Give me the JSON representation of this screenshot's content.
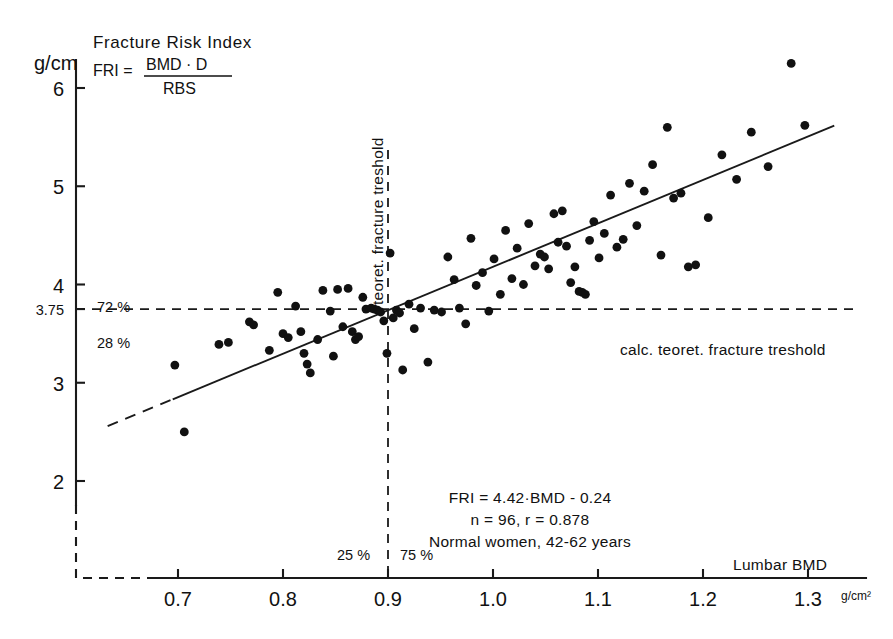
{
  "figure": {
    "title": "Fracture Risk Index",
    "formula": {
      "lhs": "FRI =",
      "numerator": "BMD · D",
      "denominator": "RBS"
    },
    "y_unit": "g/cm",
    "x_axis_title": "Lumbar BMD",
    "x_unit": "g/cm²"
  },
  "annotations": {
    "regression_text": "FRI = 4.42·BMD - 0.24",
    "stats_text": "n = 96,  r = 0.878",
    "sample_text": "Normal women, 42-62 years",
    "vertical_threshold_label": "teoret. fracture treshold",
    "horizontal_threshold_label": "calc. teoret. fracture treshold",
    "pct_above": "72 %",
    "pct_below": "28 %",
    "pct_left": "25 %",
    "pct_right": "75 %",
    "threshold_y_label": "3.75"
  },
  "chart_data": {
    "type": "scatter",
    "title": "Fracture Risk Index",
    "xlabel": "Lumbar BMD",
    "ylabel": "g/cm",
    "xunit": "g/cm²",
    "yunit": "g/cm",
    "xlim": [
      0.63,
      1.33
    ],
    "ylim": [
      1.6,
      6.45
    ],
    "xticks": [
      0.7,
      0.8,
      0.9,
      1.0,
      1.1,
      1.2,
      1.3
    ],
    "xtick_labels": [
      "0.7",
      "0.8",
      "0.9",
      "1.0",
      "1.1",
      "1.2",
      "1.3"
    ],
    "yticks": [
      2,
      3,
      3.75,
      4,
      5,
      6
    ],
    "ytick_labels": [
      "2",
      "3",
      "3.75",
      "4",
      "5",
      "6"
    ],
    "grid": false,
    "legend": "none",
    "n": 96,
    "r": 0.878,
    "regression": {
      "slope": 4.42,
      "intercept": -0.24,
      "label": "FRI = 4.42·BMD - 0.24",
      "solid_x_range": [
        0.695,
        1.325
      ],
      "dashed_x_range": [
        0.633,
        0.695
      ]
    },
    "thresholds": {
      "horizontal_y": 3.75,
      "horizontal_label": "calc. teoret. fracture treshold",
      "vertical_x": 0.9,
      "vertical_label": "teoret. fracture treshold",
      "pct_above_horizontal": 72,
      "pct_below_horizontal": 28,
      "pct_left_vertical": 25,
      "pct_right_vertical": 75
    },
    "points": [
      [
        0.697,
        3.18
      ],
      [
        0.706,
        2.5
      ],
      [
        0.739,
        3.39
      ],
      [
        0.748,
        3.41
      ],
      [
        0.768,
        3.62
      ],
      [
        0.772,
        3.59
      ],
      [
        0.787,
        3.33
      ],
      [
        0.795,
        3.92
      ],
      [
        0.8,
        3.5
      ],
      [
        0.805,
        3.46
      ],
      [
        0.812,
        3.78
      ],
      [
        0.817,
        3.52
      ],
      [
        0.82,
        3.3
      ],
      [
        0.823,
        3.19
      ],
      [
        0.826,
        3.1
      ],
      [
        0.833,
        3.44
      ],
      [
        0.838,
        3.94
      ],
      [
        0.845,
        3.73
      ],
      [
        0.848,
        3.27
      ],
      [
        0.852,
        3.95
      ],
      [
        0.857,
        3.57
      ],
      [
        0.862,
        3.96
      ],
      [
        0.866,
        3.52
      ],
      [
        0.869,
        3.44
      ],
      [
        0.872,
        3.47
      ],
      [
        0.876,
        3.87
      ],
      [
        0.879,
        3.75
      ],
      [
        0.884,
        3.76
      ],
      [
        0.887,
        3.75
      ],
      [
        0.89,
        3.74
      ],
      [
        0.893,
        3.72
      ],
      [
        0.896,
        3.63
      ],
      [
        0.899,
        3.3
      ],
      [
        0.902,
        4.32
      ],
      [
        0.905,
        3.66
      ],
      [
        0.908,
        3.74
      ],
      [
        0.911,
        3.71
      ],
      [
        0.914,
        3.13
      ],
      [
        0.92,
        3.8
      ],
      [
        0.925,
        3.55
      ],
      [
        0.931,
        3.76
      ],
      [
        0.938,
        3.21
      ],
      [
        0.944,
        3.74
      ],
      [
        0.951,
        3.72
      ],
      [
        0.957,
        4.28
      ],
      [
        0.963,
        4.05
      ],
      [
        0.968,
        3.76
      ],
      [
        0.974,
        3.6
      ],
      [
        0.979,
        4.47
      ],
      [
        0.984,
        3.99
      ],
      [
        0.99,
        4.12
      ],
      [
        0.996,
        3.73
      ],
      [
        1.001,
        4.26
      ],
      [
        1.007,
        3.9
      ],
      [
        1.012,
        4.55
      ],
      [
        1.018,
        4.06
      ],
      [
        1.023,
        4.37
      ],
      [
        1.029,
        4.0
      ],
      [
        1.034,
        4.62
      ],
      [
        1.04,
        4.19
      ],
      [
        1.045,
        4.31
      ],
      [
        1.049,
        4.28
      ],
      [
        1.053,
        4.16
      ],
      [
        1.058,
        4.72
      ],
      [
        1.062,
        4.43
      ],
      [
        1.066,
        4.75
      ],
      [
        1.07,
        4.39
      ],
      [
        1.074,
        4.02
      ],
      [
        1.078,
        4.18
      ],
      [
        1.082,
        3.93
      ],
      [
        1.085,
        3.92
      ],
      [
        1.088,
        3.9
      ],
      [
        1.092,
        4.45
      ],
      [
        1.096,
        4.64
      ],
      [
        1.101,
        4.27
      ],
      [
        1.106,
        4.52
      ],
      [
        1.112,
        4.91
      ],
      [
        1.118,
        4.38
      ],
      [
        1.124,
        4.46
      ],
      [
        1.13,
        5.03
      ],
      [
        1.137,
        4.6
      ],
      [
        1.144,
        4.95
      ],
      [
        1.152,
        5.22
      ],
      [
        1.16,
        4.3
      ],
      [
        1.166,
        5.6
      ],
      [
        1.172,
        4.88
      ],
      [
        1.179,
        4.93
      ],
      [
        1.186,
        4.18
      ],
      [
        1.193,
        4.2
      ],
      [
        1.205,
        4.68
      ],
      [
        1.218,
        5.32
      ],
      [
        1.232,
        5.07
      ],
      [
        1.246,
        5.55
      ],
      [
        1.262,
        5.2
      ],
      [
        1.284,
        6.25
      ],
      [
        1.297,
        5.62
      ]
    ]
  }
}
